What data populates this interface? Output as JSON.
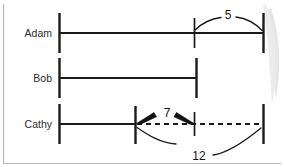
{
  "diagram": {
    "colors": {
      "line": "#1a1a1a",
      "label": "#2b2b2b",
      "border": "#b9b9b9",
      "background": "#ffffff",
      "shadow": "#dcdcdc"
    },
    "rows": [
      {
        "label": "Adam",
        "label_x": 52,
        "label_y": 37,
        "baseline_y": 33,
        "start_x": 59,
        "end_x": 263,
        "tick_x": 194
      },
      {
        "label": "Bob",
        "label_x": 52,
        "label_y": 82,
        "baseline_y": 78,
        "start_x": 59,
        "end_x": 196,
        "tick_x": null
      },
      {
        "label": "Cathy",
        "label_x": 52,
        "label_y": 128,
        "baseline_y": 124,
        "start_x": 59,
        "end_x": 263,
        "tick_x": 194,
        "solid_end_x": 135
      }
    ],
    "measures": [
      {
        "value": "5",
        "x": 228,
        "y": 19,
        "from_x": 194,
        "to_x": 263,
        "style": "curved-leaders",
        "row": "Adam"
      },
      {
        "value": "7",
        "x": 168,
        "y": 117,
        "from_x": 135,
        "to_x": 194,
        "style": "double-arrow",
        "row": "Cathy"
      },
      {
        "value": "12",
        "x": 200,
        "y": 160,
        "from_x": 135,
        "to_x": 263,
        "style": "curved-leaders",
        "row": "Cathy"
      }
    ]
  }
}
